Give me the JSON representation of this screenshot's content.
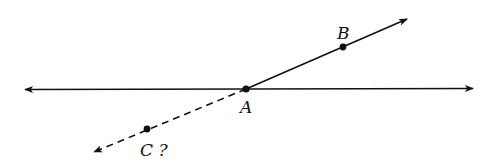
{
  "diagram": {
    "type": "geometry-figure",
    "colors": {
      "stroke": "#111111",
      "background": "#ffffff"
    },
    "points": [
      {
        "id": "A",
        "label": "A",
        "x": 246,
        "y": 89
      },
      {
        "id": "B",
        "label": "B",
        "x": 343,
        "y": 47
      },
      {
        "id": "C",
        "label": "C ?",
        "x": 147,
        "y": 129
      }
    ],
    "lines": [
      {
        "id": "horizontal-line",
        "style": "solid",
        "arrows": "both"
      },
      {
        "id": "ray-AB",
        "style": "solid",
        "from": "A",
        "through": "B",
        "arrows": "end"
      },
      {
        "id": "extension-AC",
        "style": "dashed",
        "from": "A",
        "through": "C",
        "arrows": "end"
      }
    ],
    "labels": {
      "A": "A",
      "B": "B",
      "C": "C ?"
    }
  }
}
